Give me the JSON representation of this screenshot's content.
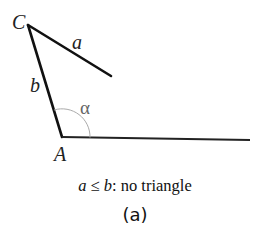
{
  "diagram": {
    "labels": {
      "vertex_c": "C",
      "vertex_a": "A",
      "side_a": "a",
      "side_b": "b",
      "angle": "α"
    },
    "condition": {
      "lhs": "a",
      "op": " ≤ ",
      "rhs": "b",
      "text": ": no triangle"
    },
    "caption": "(a)",
    "colors": {
      "line": "#111111",
      "arc": "#aaaaaa",
      "background": "#ffffff"
    }
  }
}
